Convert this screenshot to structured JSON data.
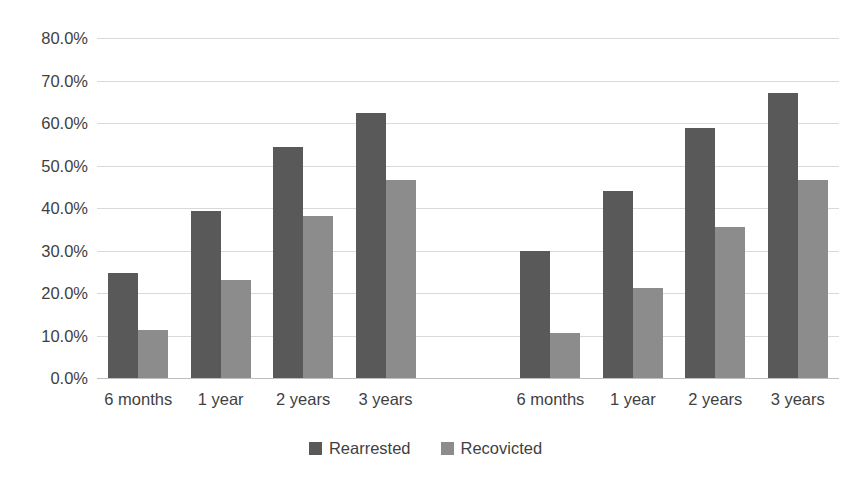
{
  "chart_data": {
    "type": "bar",
    "title": "",
    "subtitle": "",
    "xlabel": "",
    "ylabel": "",
    "ylim": [
      0,
      80
    ],
    "y_ticks": [
      "0.0%",
      "10.0%",
      "20.0%",
      "30.0%",
      "40.0%",
      "50.0%",
      "60.0%",
      "70.0%",
      "80.0%"
    ],
    "y_tick_values": [
      0,
      10,
      20,
      30,
      40,
      50,
      60,
      70,
      80
    ],
    "grid": true,
    "legend_position": "bottom",
    "categories": [
      "6 months",
      "1 year",
      "2 years",
      "3 years",
      "",
      "6 months",
      "1 year",
      "2 years",
      "3 years"
    ],
    "series": [
      {
        "name": "Rearrested",
        "color": "#595959",
        "values": [
          24.8,
          39.4,
          54.3,
          62.3,
          null,
          29.8,
          44.0,
          58.9,
          67.0
        ]
      },
      {
        "name": "Recovicted",
        "color": "#8c8c8c",
        "values": [
          11.2,
          23.1,
          38.2,
          46.6,
          null,
          10.5,
          21.2,
          35.5,
          46.5
        ]
      }
    ],
    "annotations": []
  },
  "legend": {
    "items": [
      {
        "label": "Rearrested",
        "swatch": "legend-swatch-rearrested"
      },
      {
        "label": "Recovicted",
        "swatch": "legend-swatch-recovicted"
      }
    ]
  }
}
